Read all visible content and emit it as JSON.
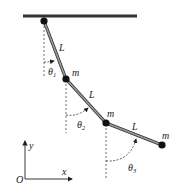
{
  "diagram": {
    "links": [
      {
        "label": "L"
      },
      {
        "label": "L"
      },
      {
        "label": "L"
      }
    ],
    "masses": [
      {
        "label": "m"
      },
      {
        "label": "m"
      },
      {
        "label": "m"
      }
    ],
    "angles": [
      {
        "symbol": "θ",
        "sub": "1"
      },
      {
        "symbol": "θ",
        "sub": "2"
      },
      {
        "symbol": "θ",
        "sub": "3"
      }
    ],
    "axes": {
      "origin": "O",
      "x": "x",
      "y": "y"
    },
    "colors": {
      "rod": "#8a8a8a",
      "rod_edge": "#333333",
      "bar": "#333333",
      "mass": "#111111"
    }
  }
}
